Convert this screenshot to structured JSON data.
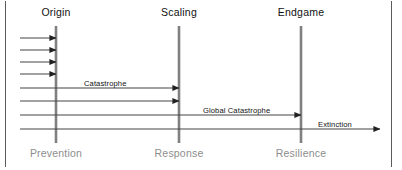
{
  "figure": {
    "background_color": "#ffffff",
    "frame_color": "#5a5a5a",
    "phase_line_color": "#808080",
    "flow_line_color": "#444444",
    "top_label_color": "#111111",
    "bottom_label_color": "#8d8d8d"
  },
  "phases": [
    {
      "id": "origin",
      "top_label": "Origin",
      "bottom_label": "Prevention",
      "x": 56
    },
    {
      "id": "scaling",
      "top_label": "Scaling",
      "bottom_label": "Response",
      "x": 179
    },
    {
      "id": "endgame",
      "top_label": "Endgame",
      "bottom_label": "Resilience",
      "x": 301
    }
  ],
  "flows": [
    {
      "id": "incident-1",
      "label": "",
      "x1": 20,
      "x2": 56,
      "y": 38
    },
    {
      "id": "incident-2",
      "label": "",
      "x1": 20,
      "x2": 56,
      "y": 50
    },
    {
      "id": "incident-3",
      "label": "",
      "x1": 20,
      "x2": 56,
      "y": 62
    },
    {
      "id": "incident-4",
      "label": "",
      "x1": 20,
      "x2": 56,
      "y": 74
    },
    {
      "id": "catastrophe-1",
      "label": "Catastrophe",
      "x1": 20,
      "x2": 179,
      "y": 88,
      "label_x": 84,
      "label_y": 79
    },
    {
      "id": "catastrophe-2",
      "label": "",
      "x1": 20,
      "x2": 179,
      "y": 101
    },
    {
      "id": "global-catastrophe",
      "label": "Global Catastrophe",
      "x1": 20,
      "x2": 301,
      "y": 115,
      "label_x": 203,
      "label_y": 106
    },
    {
      "id": "extinction",
      "label": "Extinction",
      "x1": 20,
      "x2": 380,
      "y": 129,
      "label_x": 318,
      "label_y": 120
    }
  ],
  "flow_labels": [
    {
      "id": "catastrophe-label",
      "text": "Catastrophe"
    },
    {
      "id": "global-catastrophe-label",
      "text": "Global Catastrophe"
    },
    {
      "id": "extinction-label",
      "text": "Extinction"
    }
  ]
}
